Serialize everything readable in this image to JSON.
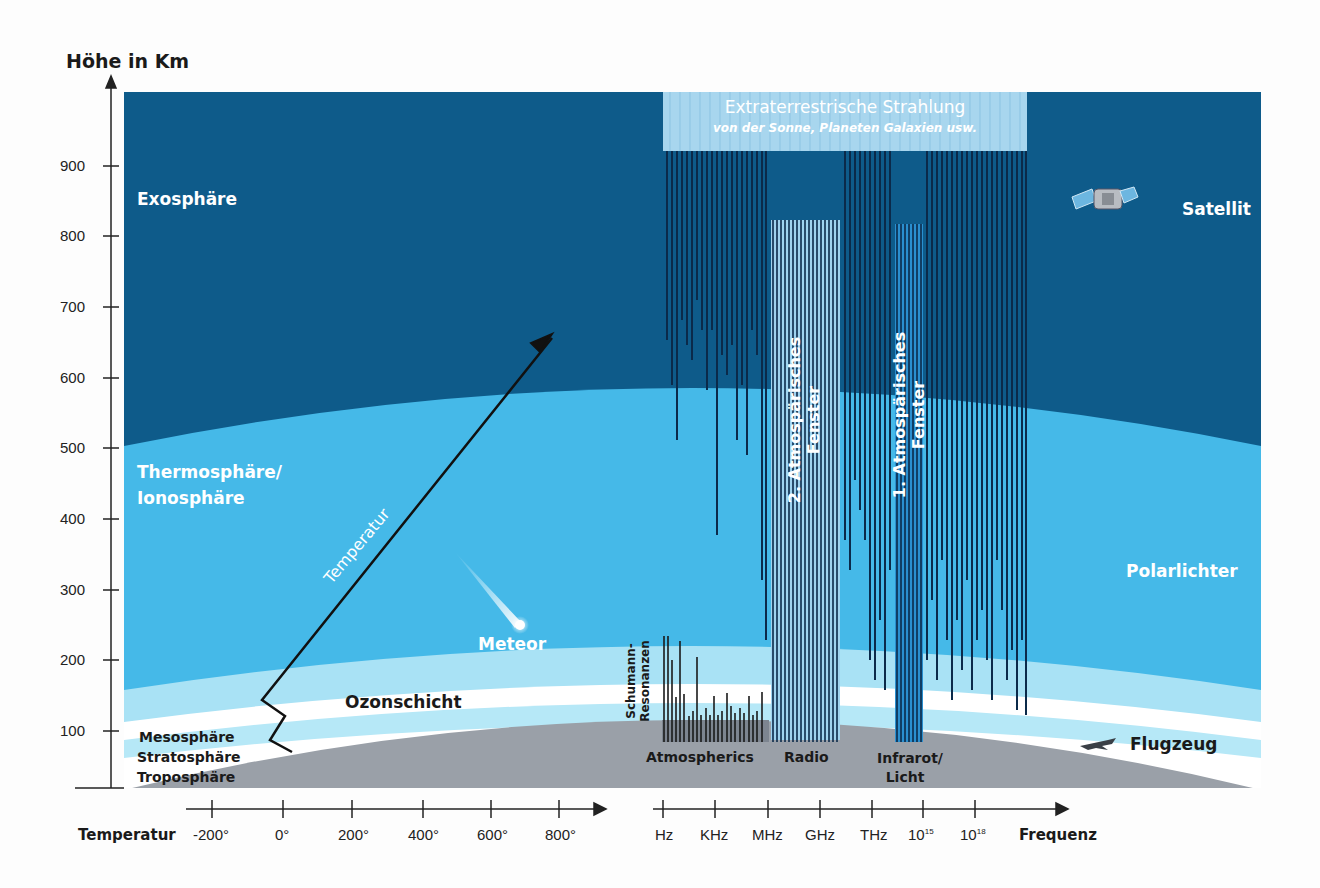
{
  "title": "Höhe in Km",
  "y_axis": {
    "label": "Höhe in Km",
    "ticks": [
      "900",
      "800",
      "700",
      "600",
      "500",
      "400",
      "300",
      "200",
      "100"
    ]
  },
  "layers": {
    "exosphere": "Exosphäre",
    "thermosphere_line1": "Thermosphäre/",
    "thermosphere_line2": "Ionosphäre",
    "mesosphere": "Mesosphäre",
    "stratosphere": "Stratosphäre",
    "troposphere": "Troposphäre",
    "ozone": "Ozonschicht"
  },
  "objects": {
    "satellite": "Satellit",
    "aurora": "Polarlichter",
    "airplane": "Flugzeug",
    "meteor": "Meteor",
    "temperature_curve": "Temperatur"
  },
  "radiation": {
    "title": "Extraterrestrische Strahlung",
    "subtitle": "von der Sonne, Planeten Galaxien usw.",
    "window2_line1": "2. Atmospärisches",
    "window2_line2": "Fenster",
    "window1_line1": "1. Atmospärisches",
    "window1_line2": "Fenster",
    "schumann_line1": "Schumann-",
    "schumann_line2": "Resonanzen",
    "atmospherics": "Atmospherics",
    "radio": "Radio",
    "infrared_line1": "Infrarot/",
    "infrared_line2": "Licht"
  },
  "temperature_axis": {
    "label": "Temperatur",
    "ticks": [
      "-200°",
      "0°",
      "200°",
      "400°",
      "600°",
      "800°"
    ]
  },
  "frequency_axis": {
    "label": "Frequenz",
    "ticks": [
      "Hz",
      "KHz",
      "MHz",
      "GHz",
      "THz",
      "10",
      "10"
    ],
    "superscripts": [
      "",
      "",
      "",
      "",
      "",
      "15",
      "18"
    ]
  },
  "colors": {
    "exosphere": "#0e5b8a",
    "thermosphere": "#45b9e8",
    "pale_band": "#a9e2f5",
    "white_band": "#ffffff",
    "ground": "#9aa0a8",
    "line": "#0b2a4a",
    "radiation_box": "#a8d6ee"
  }
}
